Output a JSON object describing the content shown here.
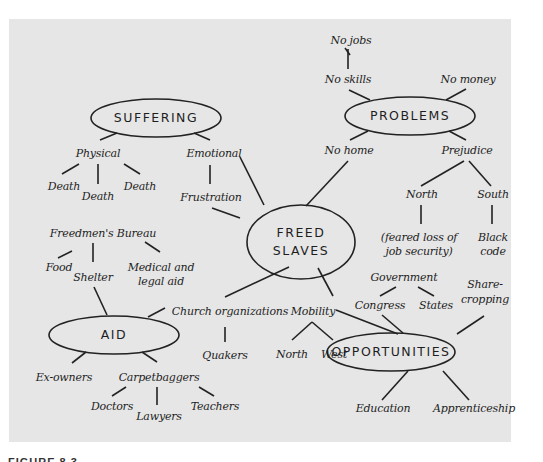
{
  "diagram": {
    "type": "concept-map",
    "background_color": "#e6e6e6",
    "center": {
      "id": "freed_slaves",
      "label": "FREED\nSLAVES",
      "line1": "FREED",
      "line2": "SLAVES"
    },
    "hubs": {
      "suffering": "SUFFERING",
      "problems": "PROBLEMS",
      "aid": "AID",
      "opportunities": "OPPORTUNITIES"
    },
    "nodes": {
      "physical": "Physical",
      "death1": "Death",
      "death2": "Death",
      "death3": "Death",
      "emotional": "Emotional",
      "frustration": "Frustration",
      "no_jobs": "No jobs",
      "no_skills": "No skills",
      "no_money": "No money",
      "no_home": "No home",
      "prejudice": "Prejudice",
      "north_prej": "North",
      "south_prej": "South",
      "feared_1": "(feared loss of",
      "feared_2": "job security)",
      "black_1": "Black",
      "black_2": "code",
      "freedmens_bureau": "Freedmen's Bureau",
      "food": "Food",
      "shelter": "Shelter",
      "medical_1": "Medical and",
      "medical_2": "legal aid",
      "church": "Church organizations",
      "quakers": "Quakers",
      "ex_owners": "Ex-owners",
      "carpetbaggers": "Carpetbaggers",
      "doctors": "Doctors",
      "lawyers": "Lawyers",
      "teachers": "Teachers",
      "mobility": "Mobility",
      "north_mob": "North",
      "west": "West",
      "government": "Government",
      "congress": "Congress",
      "states": "States",
      "share_1": "Share-",
      "share_2": "cropping",
      "education": "Education",
      "apprenticeship": "Apprenticeship"
    },
    "edges": [
      [
        "SUFFERING",
        "Physical"
      ],
      [
        "SUFFERING",
        "Emotional"
      ],
      [
        "Physical",
        "Death"
      ],
      [
        "Physical",
        "Death"
      ],
      [
        "Physical",
        "Death"
      ],
      [
        "Emotional",
        "Frustration"
      ],
      [
        "Emotional",
        "FREED SLAVES"
      ],
      [
        "Frustration",
        "FREED SLAVES"
      ],
      [
        "No jobs",
        "No skills"
      ],
      [
        "No skills",
        "PROBLEMS"
      ],
      [
        "No money",
        "PROBLEMS"
      ],
      [
        "PROBLEMS",
        "No home"
      ],
      [
        "PROBLEMS",
        "Prejudice"
      ],
      [
        "No home",
        "FREED SLAVES"
      ],
      [
        "Prejudice",
        "North"
      ],
      [
        "Prejudice",
        "South"
      ],
      [
        "North",
        "(feared loss of job security)"
      ],
      [
        "South",
        "Black code"
      ],
      [
        "Freedmen's Bureau",
        "Food"
      ],
      [
        "Freedmen's Bureau",
        "Shelter"
      ],
      [
        "Freedmen's Bureau",
        "Medical and legal aid"
      ],
      [
        "Shelter",
        "AID"
      ],
      [
        "Church organizations",
        "AID"
      ],
      [
        "Church organizations",
        "Quakers"
      ],
      [
        "FREED SLAVES",
        "Church organizations"
      ],
      [
        "FREED SLAVES",
        "Mobility"
      ],
      [
        "AID",
        "Ex-owners"
      ],
      [
        "AID",
        "Carpetbaggers"
      ],
      [
        "Carpetbaggers",
        "Doctors"
      ],
      [
        "Carpetbaggers",
        "Lawyers"
      ],
      [
        "Carpetbaggers",
        "Teachers"
      ],
      [
        "Mobility",
        "North"
      ],
      [
        "Mobility",
        "West"
      ],
      [
        "Mobility",
        "OPPORTUNITIES"
      ],
      [
        "Government",
        "Congress"
      ],
      [
        "Government",
        "States"
      ],
      [
        "Congress",
        "OPPORTUNITIES"
      ],
      [
        "Share-cropping",
        "OPPORTUNITIES"
      ],
      [
        "OPPORTUNITIES",
        "Education"
      ],
      [
        "OPPORTUNITIES",
        "Apprenticeship"
      ]
    ]
  },
  "caption": {
    "text": "FIGURE 8.3"
  }
}
